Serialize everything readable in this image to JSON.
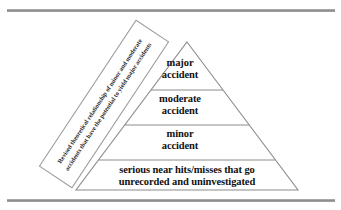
{
  "figure": {
    "type": "accident-pyramid-diagram",
    "background_color": "#ffffff",
    "line_color": "#8c8c8c",
    "text_color": "#111111"
  },
  "rules": {
    "top_label": "top-horizontal-rule",
    "bottom_label": "bottom-horizontal-rule"
  },
  "caption": {
    "text": "Revised theoretical relationship of minor and moderate accidents that have the potential to yield major accidents",
    "rotation_degrees": -56.5
  },
  "pyramid": {
    "apex": {
      "x": 187,
      "y": 42
    },
    "base_left": {
      "x": 76,
      "y": 190
    },
    "base_right": {
      "x": 298,
      "y": 190
    },
    "divider_y": [
      90,
      125,
      160
    ],
    "tiers": [
      {
        "id": "major",
        "line1": "major",
        "line2": "accident"
      },
      {
        "id": "moderate",
        "line1": "moderate",
        "line2": "accident"
      },
      {
        "id": "minor",
        "line1": "minor",
        "line2": "accident"
      },
      {
        "id": "near-hits",
        "line1": "serious near hits/misses that go",
        "line2": "unrecorded and uninvestigated"
      }
    ],
    "tier_text": {
      "major": "major\naccident",
      "moderate": "moderate\naccident",
      "minor": "minor\naccident",
      "near_hits": "serious near hits/misses that go\nunrecorded and uninvestigated"
    }
  }
}
